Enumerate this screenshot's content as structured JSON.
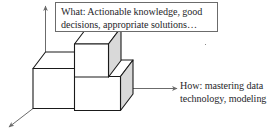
{
  "figure": {
    "type": "isometric-block-diagram",
    "background_color": "#ffffff",
    "stroke_color": "#1a1a1a",
    "face_top_color": "#ffffff",
    "face_front_color": "#ffffff",
    "face_right_color": "#d9d9d9",
    "arrow_color": "#6b6b6b",
    "box_border_color": "#6b6b6b",
    "text_color": "#26262a"
  },
  "callout": {
    "line1": "What: Actionable knowledge, good",
    "line2": "decisions, appropriate solutions…"
  },
  "side_label": {
    "line1": "How: mastering data",
    "line2": "technology, modeling"
  },
  "axes": {
    "vertical_arrow_name": "vertical-axis-arrow",
    "depth_arrow_name": "depth-axis-arrow",
    "horizontal_arrow_name": "horizontal-pointer-arrow"
  },
  "blocks": [
    {
      "name": "lower-left-block"
    },
    {
      "name": "upper-middle-block"
    },
    {
      "name": "lower-right-block"
    }
  ]
}
